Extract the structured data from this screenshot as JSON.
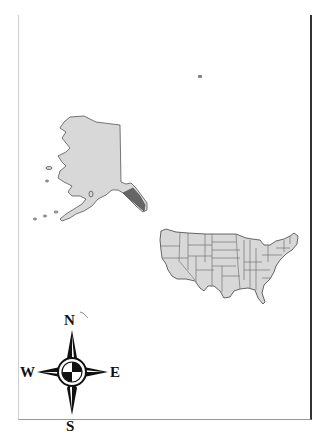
{
  "map": {
    "title": "",
    "land_fill": "#d8d8d8",
    "border_color": "#555555",
    "regions": [
      {
        "name": "Alaska"
      },
      {
        "name": "Contiguous United States"
      },
      {
        "name": "Hawaii (speck)"
      }
    ]
  },
  "compass": {
    "north": "N",
    "south": "S",
    "east": "E",
    "west": "W"
  }
}
